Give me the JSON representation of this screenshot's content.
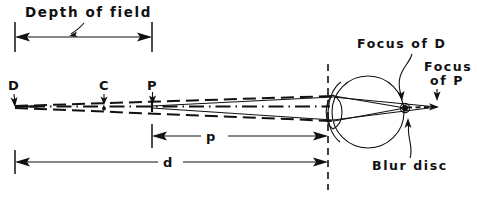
{
  "figure": {
    "type": "optics-ray-diagram",
    "background_color": "#ffffff",
    "ink_color": "#111111",
    "width": 477,
    "height": 207
  },
  "labels": {
    "depth_of_field": "Depth of field",
    "focus_of_d": "Focus of D",
    "focus_of_p_line1": "Focus",
    "focus_of_p_line2": "of P",
    "blur_disc": "Blur disc",
    "point_d": "D",
    "point_c": "C",
    "point_p": "P",
    "dim_p": "p",
    "dim_d": "d"
  },
  "dimensions": {
    "depth_of_field": {
      "label": "Depth of field",
      "x_start": 15,
      "x_end": 152,
      "y": 37,
      "style": "double-arrow-with-end-ticks"
    },
    "p": {
      "label": "p",
      "x_start": 152,
      "x_end": 328,
      "y": 136,
      "style": "double-arrow-with-end-ticks",
      "meaning": "distance from P to lens plane"
    },
    "d": {
      "label": "d",
      "x_start": 15,
      "x_end": 328,
      "y": 162,
      "style": "double-arrow-with-end-ticks",
      "meaning": "distance from D to lens plane"
    }
  },
  "object_points": [
    {
      "name": "D",
      "x": 15,
      "y": 106,
      "label_x": 13,
      "label_y": 90,
      "note": "far point of depth of field"
    },
    {
      "name": "C",
      "x": 104,
      "y": 106,
      "label_x": 101,
      "label_y": 90,
      "note": "point on axis between D and P"
    },
    {
      "name": "P",
      "x": 152,
      "y": 106,
      "label_x": 150,
      "label_y": 90,
      "note": "near object point, in focus plane"
    }
  ],
  "eye": {
    "center_x": 368,
    "center_y": 112,
    "radius": 36,
    "lens_plane_x": 328,
    "retina_focus_x": 405,
    "retina_focus_y": 108,
    "external_focus_x": 437,
    "external_focus_y": 107
  },
  "annotations": [
    {
      "name": "focus-of-d",
      "text": "Focus of D",
      "text_x": 357,
      "text_y": 48,
      "target_x": 402,
      "target_y": 101
    },
    {
      "name": "focus-of-p",
      "text": "Focus of P",
      "text_x": 424,
      "text_y": 75,
      "target_x": 436,
      "target_y": 100
    },
    {
      "name": "blur-disc",
      "text": "Blur disc",
      "text_x": 372,
      "text_y": 170,
      "target_x": 409,
      "target_y": 120
    }
  ]
}
